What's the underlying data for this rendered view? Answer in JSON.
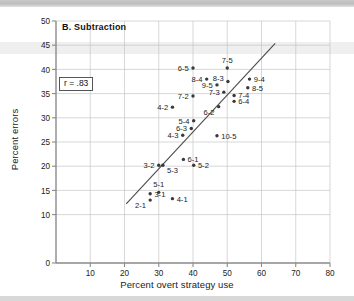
{
  "figure": {
    "panel_label": "B. Subtraction",
    "r_annotation": "r = .83",
    "xlabel": "Percent overt strategy use",
    "ylabel": "Percent errors"
  },
  "chart_data": {
    "type": "scatter",
    "title": "B. Subtraction",
    "xlabel": "Percent overt strategy use",
    "ylabel": "Percent errors",
    "xlim": [
      0,
      80
    ],
    "ylim": [
      0,
      50
    ],
    "xticks": [
      10,
      20,
      30,
      40,
      50,
      60,
      70,
      80
    ],
    "yticks": [
      0,
      15,
      20,
      25,
      30,
      35,
      40,
      45,
      50
    ],
    "ytick_labels": [
      "0",
      "15",
      "20",
      "25",
      "30",
      "35",
      "40",
      "45",
      "50"
    ],
    "ytick_extra": [
      10
    ],
    "grid": "both",
    "legend": "none",
    "annotations": [
      {
        "text": "r = .83",
        "x": 12,
        "y": 37.5,
        "boxed": true
      },
      {
        "text": "B. Subtraction",
        "x": 14,
        "y": 47.5,
        "boxed": false
      }
    ],
    "correlation_r": 0.83,
    "trendline": {
      "x": [
        20.5,
        64.0
      ],
      "y": [
        12.2,
        45.4
      ],
      "style": "solid"
    },
    "point_labels_note": "Each point is labeled with a grade-problem identifier of the form N-M",
    "points": [
      {
        "label": "6-5",
        "x": 40.0,
        "y": 40.3,
        "label_side": "left"
      },
      {
        "label": "7-5",
        "x": 50.0,
        "y": 40.3,
        "label_side": "top"
      },
      {
        "label": "8-4",
        "x": 44.0,
        "y": 38.0,
        "label_side": "left"
      },
      {
        "label": "8-3",
        "x": 50.2,
        "y": 37.5,
        "label_side": "topleft"
      },
      {
        "label": "9-4",
        "x": 56.5,
        "y": 38.0,
        "label_side": "right"
      },
      {
        "label": "9-5",
        "x": 47.0,
        "y": 36.8,
        "label_side": "left"
      },
      {
        "label": "8-5",
        "x": 56.0,
        "y": 36.2,
        "label_side": "right"
      },
      {
        "label": "7-3",
        "x": 49.0,
        "y": 35.3,
        "label_side": "left"
      },
      {
        "label": "7-2",
        "x": 40.0,
        "y": 34.5,
        "label_side": "left"
      },
      {
        "label": "7-4",
        "x": 52.0,
        "y": 34.6,
        "label_side": "right"
      },
      {
        "label": "4-2",
        "x": 34.0,
        "y": 32.2,
        "label_side": "left"
      },
      {
        "label": "6-4",
        "x": 52.0,
        "y": 33.4,
        "label_side": "right"
      },
      {
        "label": "6-2",
        "x": 47.5,
        "y": 32.3,
        "label_side": "bottomleft"
      },
      {
        "label": "5-4",
        "x": 40.2,
        "y": 29.4,
        "label_side": "left"
      },
      {
        "label": "6-3",
        "x": 39.5,
        "y": 27.8,
        "label_side": "left"
      },
      {
        "label": "4-3",
        "x": 37.0,
        "y": 26.4,
        "label_side": "left"
      },
      {
        "label": "10-5",
        "x": 47.0,
        "y": 26.3,
        "label_side": "right"
      },
      {
        "label": "6-1",
        "x": 37.2,
        "y": 21.4,
        "label_side": "right"
      },
      {
        "label": "3-2",
        "x": 30.0,
        "y": 20.2,
        "label_side": "left"
      },
      {
        "label": "5-3",
        "x": 31.2,
        "y": 20.2,
        "label_side": "bottomright"
      },
      {
        "label": "5-2",
        "x": 40.2,
        "y": 20.2,
        "label_side": "right"
      },
      {
        "label": "5-1",
        "x": 30.0,
        "y": 14.6,
        "label_side": "top"
      },
      {
        "label": "3-1",
        "x": 27.5,
        "y": 14.3,
        "label_side": "right"
      },
      {
        "label": "2-1",
        "x": 27.5,
        "y": 13.0,
        "label_side": "bottomleft"
      },
      {
        "label": "4-1",
        "x": 34.0,
        "y": 13.3,
        "label_side": "right"
      }
    ]
  },
  "colors": {
    "background": "#ffffff",
    "axis": "#8a8a8a",
    "grid": "#c6c6c6",
    "point": "#3a3a3a",
    "text": "#222222",
    "trendline": "#4a4a4a"
  }
}
